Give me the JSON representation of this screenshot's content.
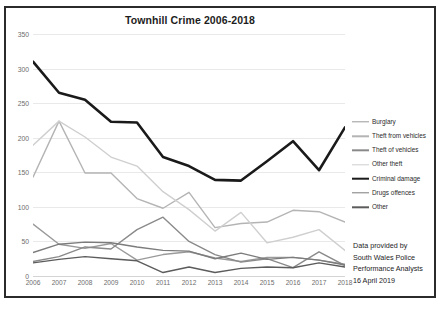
{
  "chart_data": {
    "type": "line",
    "title": "Townhill Crime 2006-2018",
    "xlabel": "",
    "ylabel": "",
    "ylim": [
      0,
      350
    ],
    "yticks": [
      0,
      50,
      100,
      150,
      200,
      250,
      300,
      350
    ],
    "grid": true,
    "legend_position": "right",
    "categories": [
      "2006",
      "2007",
      "2008",
      "2009",
      "2010",
      "2011",
      "2012",
      "2013",
      "2014",
      "2015",
      "2016",
      "2017",
      "2018"
    ],
    "series": [
      {
        "name": "Burglary",
        "color": "#9a9a9a",
        "width": 1.4,
        "values": [
          75,
          46,
          40,
          47,
          23,
          31,
          35,
          26,
          21,
          27,
          27,
          23,
          17
        ]
      },
      {
        "name": "Theft from vehicles",
        "color": "#b4b4b4",
        "width": 1.4,
        "values": [
          143,
          224,
          149,
          149,
          112,
          98,
          121,
          70,
          76,
          78,
          95,
          93,
          78
        ]
      },
      {
        "name": "Theft of vehicles",
        "color": "#8a8a8a",
        "width": 1.4,
        "values": [
          21,
          28,
          42,
          39,
          67,
          85,
          50,
          31,
          20,
          25,
          12,
          35,
          15
        ]
      },
      {
        "name": "Other theft",
        "color": "#cfcfcf",
        "width": 1.4,
        "values": [
          189,
          224,
          201,
          172,
          159,
          122,
          96,
          65,
          92,
          48,
          56,
          67,
          37
        ]
      },
      {
        "name": "Criminal damage",
        "color": "#1a1a1a",
        "width": 2.6,
        "values": [
          310,
          265,
          255,
          223,
          222,
          172,
          159,
          139,
          138,
          166,
          195,
          153,
          215
        ]
      },
      {
        "name": "Drugs offences",
        "color": "#7c7c7c",
        "width": 1.4,
        "values": [
          34,
          46,
          49,
          48,
          42,
          37,
          36,
          25,
          33,
          24,
          27,
          23,
          16
        ]
      },
      {
        "name": "Other",
        "color": "#5c5c5c",
        "width": 1.4,
        "values": [
          19,
          24,
          28,
          25,
          22,
          5,
          13,
          5,
          11,
          13,
          12,
          19,
          13
        ]
      }
    ],
    "annotation": {
      "lines": [
        "Data provided by",
        "South Wales Police",
        "Performance Analysts",
        "16 April 2019"
      ]
    }
  }
}
